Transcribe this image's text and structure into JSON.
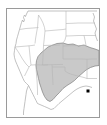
{
  "figure": {
    "kind": "distribution-range-map",
    "region_title": "Western and Central United States",
    "frame": {
      "x": 6,
      "y": 8,
      "width": 94,
      "height": 110,
      "border_color": "#9a9a9a",
      "background_color": "#ffffff"
    }
  },
  "map": {
    "projection_note": "unlabeled outline map, no graticule, no scale bar, no legend",
    "coastline_color": "#a8a8a8",
    "state_border_color": "#b5b5b5",
    "shaded_range": {
      "label": "shaded range area",
      "fill_color": "#c9c9c9",
      "outline_color": "#808080",
      "covered_states": [
        "Colorado",
        "Kansas",
        "Oklahoma",
        "New Mexico",
        "Texas",
        "Nebraska",
        "Missouri",
        "Arkansas"
      ]
    },
    "point_markers": [
      {
        "label": "locality point",
        "color": "#000000",
        "x": 88,
        "y": 91,
        "size": 3,
        "approximate_location": "eastern Texas near the Louisiana border"
      }
    ]
  }
}
